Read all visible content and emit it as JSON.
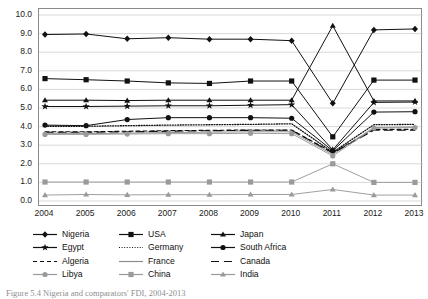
{
  "chart_data": {
    "type": "line",
    "title": "",
    "xlabel": "",
    "ylabel": "",
    "x": [
      2004,
      2005,
      2006,
      2007,
      2008,
      2009,
      2010,
      2011,
      2012,
      2013
    ],
    "categories": [
      "2004",
      "2005",
      "2006",
      "2007",
      "2008",
      "2009",
      "2010",
      "2011",
      "2012",
      "2013"
    ],
    "ylim": [
      0.0,
      10.0
    ],
    "ytick_step": 1.0,
    "yticks": [
      "0.0",
      "1.0",
      "2.0",
      "3.0",
      "4.0",
      "5.0",
      "6.0",
      "7.0",
      "8.0",
      "9.0",
      "10.0"
    ],
    "grid": "horizontal",
    "legend_position": "below-axes",
    "legend_columns": 3,
    "series": [
      {
        "name": "Nigeria",
        "marker": "diamond",
        "line": "solid",
        "color": "#111111",
        "values": [
          8.95,
          8.98,
          8.72,
          8.78,
          8.7,
          8.7,
          8.62,
          5.25,
          9.2,
          9.25
        ]
      },
      {
        "name": "USA",
        "marker": "square",
        "line": "solid",
        "color": "#111111",
        "values": [
          6.58,
          6.52,
          6.45,
          6.35,
          6.32,
          6.45,
          6.45,
          3.45,
          6.5,
          6.5
        ]
      },
      {
        "name": "Japan",
        "marker": "triangle",
        "line": "solid",
        "color": "#111111",
        "values": [
          5.42,
          5.42,
          5.4,
          5.42,
          5.42,
          5.42,
          5.42,
          9.42,
          5.38,
          5.38
        ]
      },
      {
        "name": "Egypt",
        "marker": "star",
        "line": "solid",
        "color": "#111111",
        "values": [
          5.08,
          5.08,
          5.1,
          5.12,
          5.12,
          5.15,
          5.18,
          2.75,
          5.3,
          5.32
        ]
      },
      {
        "name": "Germany",
        "marker": "none",
        "line": "dotted",
        "color": "#111111",
        "values": [
          4.02,
          4.02,
          4.05,
          4.08,
          4.1,
          4.12,
          4.15,
          2.62,
          4.1,
          4.12
        ]
      },
      {
        "name": "South Africa",
        "marker": "circle",
        "line": "solid",
        "color": "#111111",
        "values": [
          4.08,
          4.05,
          4.38,
          4.48,
          4.48,
          4.48,
          4.45,
          2.7,
          4.78,
          4.8
        ]
      },
      {
        "name": "Algeria",
        "marker": "none",
        "line": "dashed",
        "color": "#111111",
        "values": [
          3.72,
          3.72,
          3.75,
          3.78,
          3.8,
          3.82,
          3.82,
          2.6,
          3.85,
          3.85
        ]
      },
      {
        "name": "France",
        "marker": "none",
        "line": "solid",
        "color": "#8c8c8c",
        "values": [
          3.62,
          3.62,
          3.65,
          3.68,
          3.7,
          3.72,
          3.72,
          2.5,
          3.95,
          3.98
        ]
      },
      {
        "name": "Canada",
        "marker": "none",
        "line": "long-dash",
        "color": "#111111",
        "values": [
          3.7,
          3.7,
          3.72,
          3.75,
          3.78,
          3.8,
          3.8,
          2.58,
          3.8,
          3.8
        ]
      },
      {
        "name": "Libya",
        "marker": "circle",
        "line": "solid",
        "color": "#9a9a9a",
        "values": [
          3.58,
          3.58,
          3.6,
          3.62,
          3.62,
          3.64,
          3.62,
          2.42,
          3.92,
          3.95
        ]
      },
      {
        "name": "China",
        "marker": "square",
        "line": "solid",
        "color": "#9a9a9a",
        "values": [
          1.02,
          1.02,
          1.02,
          1.02,
          1.02,
          1.02,
          1.02,
          2.0,
          1.0,
          1.0
        ]
      },
      {
        "name": "India",
        "marker": "triangle",
        "line": "solid",
        "color": "#9a9a9a",
        "values": [
          0.32,
          0.35,
          0.33,
          0.34,
          0.34,
          0.35,
          0.35,
          0.62,
          0.32,
          0.32
        ]
      }
    ]
  },
  "legend": {
    "items": [
      {
        "label": "Nigeria"
      },
      {
        "label": "USA"
      },
      {
        "label": "Japan"
      },
      {
        "label": "Egypt"
      },
      {
        "label": "Germany"
      },
      {
        "label": "South Africa"
      },
      {
        "label": "Algeria"
      },
      {
        "label": "France"
      },
      {
        "label": "Canada"
      },
      {
        "label": "Libya"
      },
      {
        "label": "China"
      },
      {
        "label": "India"
      }
    ]
  },
  "caption": "Figure 5.4  Nigeria and comparators' FDI, 2004-2013"
}
